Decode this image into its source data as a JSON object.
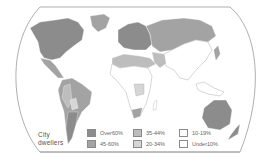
{
  "map": {
    "title": "City dwellers",
    "title_lines": [
      "City",
      "dwellers"
    ],
    "subject": "Urban population share by country",
    "colors": {
      "frame": "#9a9a9a",
      "ocean": "#ffffff",
      "border": "#ffffff"
    }
  },
  "legend": {
    "items": [
      {
        "label": "Over60%",
        "color": "#8c8c8c"
      },
      {
        "label": "45-60%",
        "color": "#a3a3a3"
      },
      {
        "label": "35-44%",
        "color": "#bdbdbd"
      },
      {
        "label": "20-34%",
        "color": "#d6d6d6"
      },
      {
        "label": "10-19%",
        "color": "#ffffff"
      },
      {
        "label": "Under10%",
        "color": "#ffffff"
      }
    ]
  }
}
